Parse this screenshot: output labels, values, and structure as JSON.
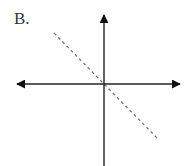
{
  "diagram": {
    "label": "B.",
    "axes": {
      "origin": [
        104,
        84
      ],
      "x_axis": {
        "from": [
          16,
          84
        ],
        "to": [
          180,
          84
        ],
        "arrows": "both",
        "color": "#222222"
      },
      "y_axis": {
        "from": [
          104,
          166
        ],
        "to": [
          104,
          14
        ],
        "arrows": "top",
        "color": "#222222"
      }
    },
    "line": {
      "style": "dashed",
      "slope": "negative",
      "passes_through_origin": true,
      "from": [
        54,
        33
      ],
      "to": [
        157,
        138
      ],
      "color": "#777777"
    }
  }
}
